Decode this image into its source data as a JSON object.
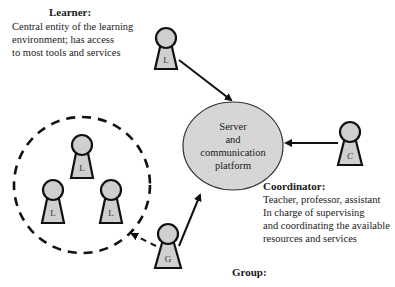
{
  "learner": {
    "title": "Learner:",
    "lines": [
      "Central entity of the learning",
      "environment; has access",
      "to most tools and services"
    ]
  },
  "server": {
    "lines": [
      "Server",
      "and",
      "communication",
      "platform"
    ],
    "fill": "#d6d6d6"
  },
  "coordinator": {
    "title": "Coordinator:",
    "lines": [
      "Teacher, professor, assistant",
      "In charge of supervising",
      "and coordinating the available",
      "resources and services"
    ]
  },
  "group": {
    "title": "Group:"
  },
  "pawns": {
    "learner_top": "L",
    "group_top": "L",
    "group_left": "L",
    "group_right": "L",
    "coordinator": "C",
    "group_rep": "G"
  },
  "colors": {
    "pawn_fill": "#cfcfcf",
    "stroke": "#111111",
    "background": "#ffffff"
  }
}
